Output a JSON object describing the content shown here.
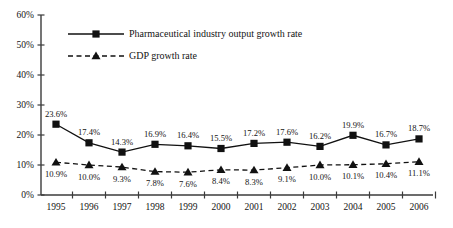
{
  "chart_data": {
    "type": "line",
    "title": "",
    "subtitle": "",
    "xlabel": "",
    "ylabel": "",
    "grid": false,
    "legend_position": "top-left-inside",
    "categories": [
      "1995",
      "1996",
      "1997",
      "1998",
      "1999",
      "2000",
      "2001",
      "2002",
      "2003",
      "2004",
      "2005",
      "2006"
    ],
    "ylim": [
      0,
      60
    ],
    "yticks": [
      0,
      10,
      20,
      30,
      40,
      50,
      60
    ],
    "ytick_labels": [
      "0%",
      "10%",
      "20%",
      "30%",
      "40%",
      "50%",
      "60%"
    ],
    "series": [
      {
        "name": "Pharmaceutical industry output growth rate",
        "marker": "square",
        "line_style": "solid",
        "color": "#111111",
        "values": [
          23.6,
          17.4,
          14.3,
          16.9,
          16.4,
          15.5,
          17.2,
          17.6,
          16.2,
          19.9,
          16.7,
          18.7
        ],
        "data_labels": [
          "23.6%",
          "17.4%",
          "14.3%",
          "16.9%",
          "16.4%",
          "15.5%",
          "17.2%",
          "17.6%",
          "16.2%",
          "19.9%",
          "16.7%",
          "18.7%"
        ]
      },
      {
        "name": "GDP growth rate",
        "marker": "triangle",
        "line_style": "dashed",
        "color": "#111111",
        "values": [
          10.9,
          10.0,
          9.3,
          7.8,
          7.6,
          8.4,
          8.3,
          9.1,
          10.0,
          10.1,
          10.4,
          11.1
        ],
        "data_labels": [
          "10.9%",
          "10.0%",
          "9.3%",
          "7.8%",
          "7.6%",
          "8.4%",
          "8.3%",
          "9.1%",
          "10.0%",
          "10.1%",
          "10.4%",
          "11.1%"
        ]
      }
    ]
  },
  "legend": {
    "items": [
      {
        "label": "Pharmaceutical industry output growth rate",
        "marker": "square",
        "line_style": "solid"
      },
      {
        "label": "GDP growth rate",
        "marker": "triangle",
        "line_style": "dashed"
      }
    ]
  }
}
